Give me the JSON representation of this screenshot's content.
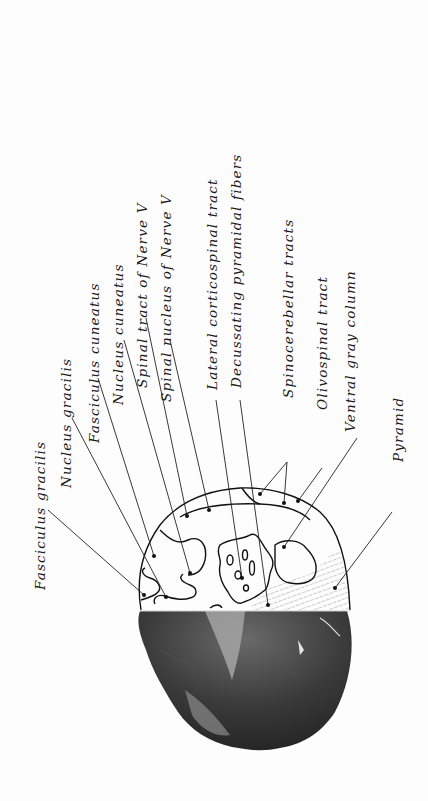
{
  "figure": {
    "labels": [
      {
        "id": "fasciculus-gracilis",
        "text": "Fasciculus gracilis"
      },
      {
        "id": "nucleus-gracilis",
        "text": "Nucleus gracilis"
      },
      {
        "id": "fasciculus-cuneatus",
        "text": "Fasciculus cuneatus"
      },
      {
        "id": "nucleus-cuneatus",
        "text": "Nucleus cuneatus"
      },
      {
        "id": "spinal-tract-nerve-v",
        "text": "Spinal tract of Nerve V"
      },
      {
        "id": "spinal-nucleus-nerve-v",
        "text": "Spinal nucleus of Nerve V"
      },
      {
        "id": "lateral-corticospinal-tract",
        "text": "Lateral corticospinal tract"
      },
      {
        "id": "decussating-pyramidal-fibers",
        "text": "Decussating pyramidal fibers"
      },
      {
        "id": "spinocerebellar-tracts",
        "text": "Spinocerebellar tracts"
      },
      {
        "id": "olivospinal-tract",
        "text": "Olivospinal tract"
      },
      {
        "id": "ventral-gray-column",
        "text": "Ventral gray column"
      },
      {
        "id": "pyramid",
        "text": "Pyramid"
      }
    ]
  }
}
